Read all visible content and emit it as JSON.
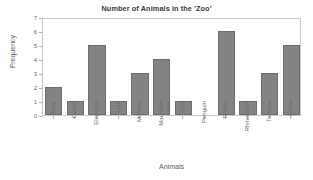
{
  "chart_data": {
    "type": "bar",
    "title": "Number of Animals in the 'Zoo'",
    "xlabel": "Animals",
    "ylabel": "Frequency",
    "categories": [
      "Bear",
      "Camel",
      "Elephant",
      "Lion",
      "Monkey",
      "Mountain Goat",
      "Owl",
      "Penguin",
      "Rabbit",
      "Rhinoceros",
      "Tortoise",
      "Zebra"
    ],
    "values": [
      2,
      1,
      5,
      1,
      3,
      4,
      1,
      0,
      6,
      1,
      3,
      5
    ],
    "ylim": [
      0,
      7
    ],
    "yticks": [
      0,
      1,
      2,
      3,
      4,
      5,
      6,
      7
    ],
    "ytick_labels": [
      "0",
      "1",
      "2",
      "3",
      "4",
      "5",
      "6",
      "7"
    ],
    "grid": false,
    "legend": null,
    "bar_color": "#838385",
    "bar_edge_color": "#6e6e70",
    "frame_color": "#c9c9cb",
    "text_color": "#6b6b6d",
    "title_color": "#3a3a3c"
  }
}
